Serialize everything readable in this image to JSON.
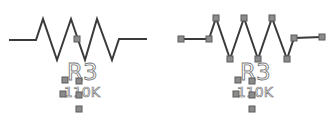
{
  "canvas": {
    "background": "#ffffff"
  },
  "components": [
    {
      "id": "left",
      "kind": "resistor",
      "state": "unselected",
      "refdes": "R3",
      "value": "110K",
      "wire_color": "#3a3a3a",
      "handle_color": "#8c8c8c"
    },
    {
      "id": "right",
      "kind": "resistor",
      "state": "vertices-selected",
      "refdes": "R3",
      "value": "110K",
      "wire_color": "#3a3a3a",
      "handle_color": "#8c8c8c"
    }
  ]
}
